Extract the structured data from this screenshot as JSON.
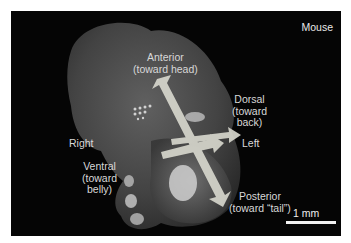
{
  "figure": {
    "species_label": "Mouse",
    "scale_bar_label": "1 mm",
    "axes": {
      "anterior": "Anterior\n(toward head)",
      "posterior": "Posterior\n(toward “tail”)",
      "dorsal": "Dorsal\n(toward\nback)",
      "ventral": "Ventral\n(toward\nbelly)",
      "left": "Left",
      "right": "Right"
    },
    "colors": {
      "background": "#050505",
      "arrow": "#d9d9cf",
      "text": "#d8d8d8"
    }
  }
}
